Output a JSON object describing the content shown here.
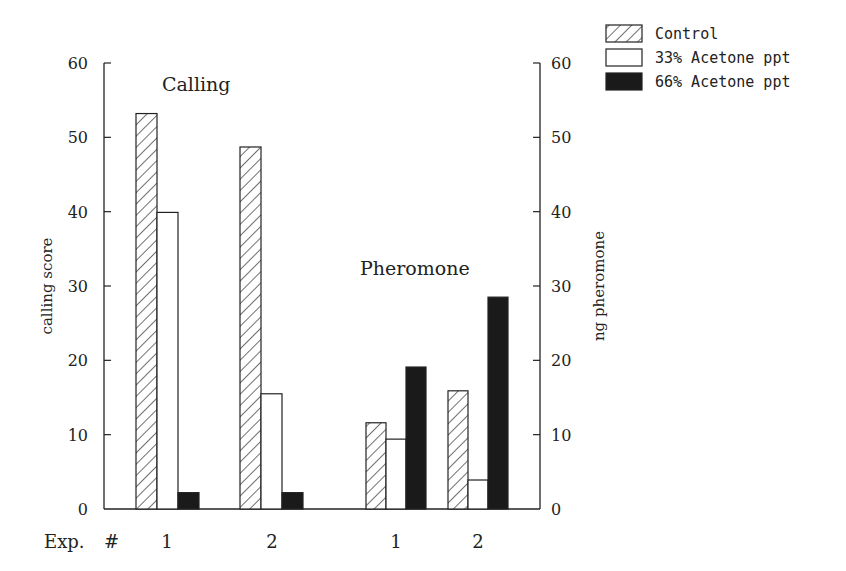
{
  "chart_data": {
    "type": "bar",
    "title": "",
    "groups": [
      {
        "name": "Calling",
        "axis": "left",
        "categories": [
          "1",
          "2"
        ]
      },
      {
        "name": "Pheromone",
        "axis": "right",
        "categories": [
          "1",
          "2"
        ]
      }
    ],
    "x_prefix_label": "Exp. #",
    "xlabel": "Exp. #",
    "ylabel": "calling score",
    "ylabel_right": "ng pheromone",
    "ylim": [
      0,
      60
    ],
    "ylim_right": [
      0,
      60
    ],
    "yticks": [
      0,
      10,
      20,
      30,
      40,
      50,
      60
    ],
    "annotations": [
      "Calling",
      "Pheromone"
    ],
    "legend_position": "top-right",
    "series": [
      {
        "name": "Control",
        "pattern": "hatched",
        "calling": [
          53.2,
          48.7
        ],
        "pheromone": [
          11.6,
          15.9
        ]
      },
      {
        "name": "33% Acetone ppt",
        "pattern": "white",
        "calling": [
          39.9,
          15.5
        ],
        "pheromone": [
          9.4,
          3.9
        ]
      },
      {
        "name": "66% Acetone ppt",
        "pattern": "black",
        "calling": [
          2.2,
          2.2
        ],
        "pheromone": [
          19.1,
          28.5
        ]
      }
    ]
  },
  "labels": {
    "ylabel_left": "calling score",
    "ylabel_right": "ng pheromone",
    "annot_calling": "Calling",
    "annot_pheromone": "Pheromone",
    "exp_label": "Exp.",
    "hash_label": "#",
    "x_cats": [
      "1",
      "2",
      "1",
      "2"
    ]
  },
  "legend": [
    "Control",
    "33% Acetone ppt",
    "66% Acetone ppt"
  ],
  "ticks": [
    "0",
    "10",
    "20",
    "30",
    "40",
    "50",
    "60"
  ]
}
